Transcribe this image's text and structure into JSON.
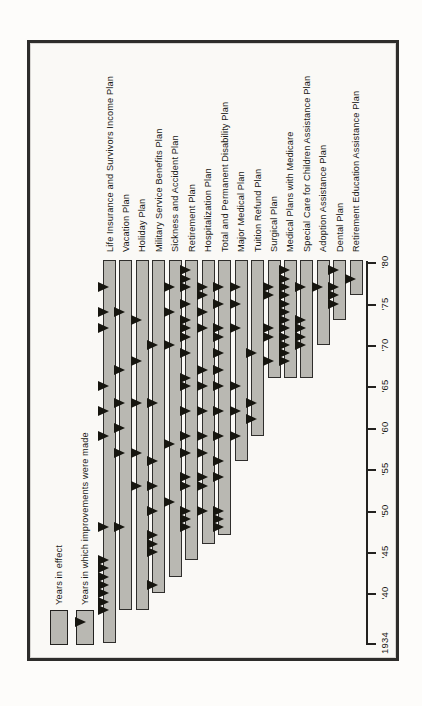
{
  "document": {
    "kind": "scanned benefits-booklet chart, rotated 90 degrees counterclockwise",
    "note": "bars show years each plan was in effect (start year through 1980); black triangles mark years in which improvements were made"
  },
  "legend": {
    "years_in_effect": "Years in effect",
    "improvements": "Years in which improvements were made"
  },
  "axis": {
    "tick_labels": [
      "1934",
      "'40",
      "'45",
      "'50",
      "'55",
      "'60",
      "'65",
      "'70",
      "'75",
      "'80"
    ],
    "tick_years": [
      1934,
      1940,
      1945,
      1950,
      1955,
      1960,
      1965,
      1970,
      1975,
      1980
    ]
  },
  "chart_data": {
    "type": "bar",
    "subtype": "timeline-gantt, rotated 90deg CCW (years run bottom-to-top, plans left-to-right)",
    "title": "",
    "xlabel": "",
    "ylabel": "",
    "time_axis": {
      "min": 1934,
      "max": 1980
    },
    "marker_meaning": "year in which an improvement was made",
    "bar_meaning": "years plan in effect, from start year through 1980",
    "plans": [
      {
        "name": "Life Insurance and Survivors Income Plan",
        "start": 1934,
        "improvements": [
          1938,
          1939,
          1940,
          1941,
          1942,
          1943,
          1944,
          1948,
          1959,
          1962,
          1965,
          1972,
          1974,
          1977
        ]
      },
      {
        "name": "Vacation Plan",
        "start": 1938,
        "improvements": [
          1948,
          1957,
          1960,
          1963,
          1967,
          1974
        ]
      },
      {
        "name": "Holiday Plan",
        "start": 1938,
        "improvements": [
          1953,
          1957,
          1963,
          1968,
          1973
        ]
      },
      {
        "name": "Military Service Benefits Plan",
        "start": 1940,
        "improvements": [
          1941,
          1945,
          1946,
          1947,
          1950,
          1953,
          1956,
          1963,
          1970
        ]
      },
      {
        "name": "Sickness and Accident Plan",
        "start": 1942,
        "improvements": [
          1951,
          1958,
          1970,
          1974,
          1977
        ]
      },
      {
        "name": "Retirement Plan",
        "start": 1944,
        "improvements": [
          1948,
          1949,
          1950,
          1953,
          1954,
          1957,
          1959,
          1962,
          1965,
          1966,
          1969,
          1971,
          1972,
          1973,
          1975,
          1977,
          1978,
          1979
        ]
      },
      {
        "name": "Hospitalization Plan",
        "start": 1946,
        "improvements": [
          1950,
          1953,
          1954,
          1957,
          1959,
          1962,
          1965,
          1967,
          1972,
          1974,
          1976,
          1977
        ]
      },
      {
        "name": "Total and Permanent Disability Plan",
        "start": 1947,
        "improvements": [
          1948,
          1949,
          1950,
          1954,
          1956,
          1959,
          1962,
          1965,
          1967,
          1969,
          1971,
          1972,
          1975,
          1977
        ]
      },
      {
        "name": "Major Medical Plan",
        "start": 1956,
        "improvements": [
          1959,
          1962,
          1965,
          1972,
          1975,
          1977
        ]
      },
      {
        "name": "Tuition Refund Plan",
        "start": 1959,
        "improvements": [
          1961,
          1963,
          1969
        ]
      },
      {
        "name": "Surgical Plan",
        "start": 1966,
        "improvements": [
          1968,
          1971,
          1972,
          1976,
          1977
        ]
      },
      {
        "name": "Medical Plans with Medicare",
        "start": 1966,
        "improvements": [
          1968,
          1969,
          1970,
          1971,
          1972,
          1973,
          1974,
          1975,
          1976,
          1977,
          1978,
          1979
        ]
      },
      {
        "name": "Special Care for Children Assistance Plan",
        "start": 1966,
        "improvements": [
          1970,
          1971,
          1972,
          1973,
          1977
        ]
      },
      {
        "name": "Adoption Assistance Plan",
        "start": 1970,
        "improvements": [
          1977
        ]
      },
      {
        "name": "Dental Plan",
        "start": 1973,
        "improvements": [
          1975,
          1976,
          1977,
          1979
        ]
      },
      {
        "name": "Retirement Education Assistance Plan",
        "start": 1976,
        "improvements": [
          1978
        ]
      }
    ]
  },
  "colors": {
    "bar_fill": "#b9b8b2",
    "bar_border": "#2f2e2c",
    "triangle": "#16150f",
    "frame_border": "#2e2d2b",
    "text": "#1b1a17",
    "paper": "#faf9f6"
  }
}
